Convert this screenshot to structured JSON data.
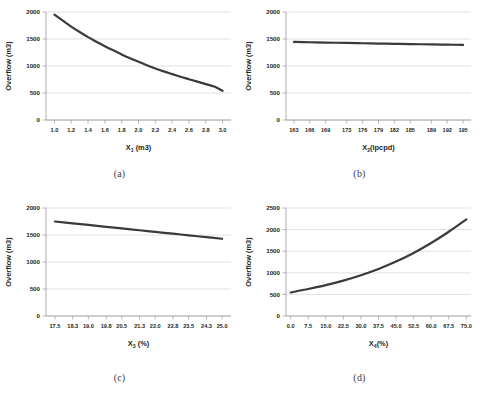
{
  "figure": {
    "background_color": "#ffffff",
    "line_color": "#3a3a3a",
    "grid_color": "#d4d4d4",
    "axis_color": "#9a9a9a",
    "panels": [
      {
        "id": "a",
        "caption": "(a)",
        "ylabel": "Overflow (m3)",
        "xlabel_main": "X",
        "xlabel_sub": "1",
        "xlabel_unit": " (m3)"
      },
      {
        "id": "b",
        "caption": "(b)",
        "ylabel": "Overflow (m3)",
        "xlabel_main": "X",
        "xlabel_sub": "2",
        "xlabel_unit": "(lpcpd)"
      },
      {
        "id": "c",
        "caption": "(c)",
        "ylabel": "Overflow (m3)",
        "xlabel_main": "X",
        "xlabel_sub": "3",
        "xlabel_unit": " (%)"
      },
      {
        "id": "d",
        "caption": "(d)",
        "ylabel": "Overflow (m3)",
        "xlabel_main": "X",
        "xlabel_sub": "4",
        "xlabel_unit": "(%)"
      }
    ]
  },
  "chart_data": [
    {
      "type": "line",
      "id": "a",
      "title": "(a)",
      "xlabel": "X1 (m3)",
      "ylabel": "Overflow (m3)",
      "xlim": [
        0.9,
        3.1
      ],
      "ylim": [
        0,
        2000
      ],
      "grid": true,
      "legend": "none",
      "xticks": [
        1.0,
        1.2,
        1.4,
        1.6,
        1.8,
        2.0,
        2.2,
        2.4,
        2.6,
        2.8,
        3.0
      ],
      "xtick_labels": [
        "1.0",
        "1.2",
        "1.4",
        "1.6",
        "1.8",
        "2.0",
        "2.2",
        "2.4",
        "2.6",
        "2.8",
        "3.0"
      ],
      "yticks": [
        0,
        500,
        1000,
        1500,
        2000
      ],
      "ytick_labels": [
        "0",
        "500",
        "1000",
        "1500",
        "2000"
      ],
      "x": [
        1.0,
        1.1,
        1.2,
        1.3,
        1.4,
        1.5,
        1.6,
        1.7,
        1.8,
        1.9,
        2.0,
        2.1,
        2.2,
        2.3,
        2.4,
        2.5,
        2.6,
        2.7,
        2.8,
        2.9,
        3.0
      ],
      "y": [
        1950,
        1840,
        1730,
        1630,
        1535,
        1450,
        1365,
        1290,
        1215,
        1145,
        1080,
        1015,
        955,
        900,
        850,
        800,
        755,
        710,
        665,
        620,
        540
      ]
    },
    {
      "type": "line",
      "id": "b",
      "title": "(b)",
      "xlabel": "X2 (lpcpd)",
      "ylabel": "Overflow (m3)",
      "xlim": [
        161.5,
        196.5
      ],
      "ylim": [
        0,
        2000
      ],
      "grid": true,
      "legend": "none",
      "xticks": [
        163,
        166,
        169,
        173,
        176,
        179,
        182,
        185,
        189,
        192,
        195
      ],
      "xtick_labels": [
        "163",
        "166",
        "169",
        "173",
        "176",
        "179",
        "182",
        "185",
        "189",
        "192",
        "195"
      ],
      "yticks": [
        0,
        500,
        1000,
        1500,
        2000
      ],
      "ytick_labels": [
        "0",
        "500",
        "1000",
        "1500",
        "2000"
      ],
      "x": [
        163,
        166,
        169,
        173,
        176,
        179,
        182,
        185,
        189,
        192,
        195
      ],
      "y": [
        1445,
        1440,
        1434,
        1427,
        1421,
        1416,
        1411,
        1406,
        1400,
        1395,
        1390
      ]
    },
    {
      "type": "line",
      "id": "c",
      "title": "(c)",
      "xlabel": "X3 (%)",
      "ylabel": "Overflow (m3)",
      "xlim": [
        17.1,
        25.4
      ],
      "ylim": [
        0,
        2000
      ],
      "grid": true,
      "legend": "none",
      "xticks": [
        17.5,
        18.3,
        19.0,
        19.8,
        20.5,
        21.3,
        22.0,
        22.8,
        23.5,
        24.3,
        25.0
      ],
      "xtick_labels": [
        "17.5",
        "18.3",
        "19.0",
        "19.8",
        "20.5",
        "21.3",
        "22.0",
        "22.8",
        "23.5",
        "24.3",
        "25.0"
      ],
      "yticks": [
        0,
        500,
        1000,
        1500,
        2000
      ],
      "ytick_labels": [
        "0",
        "500",
        "1000",
        "1500",
        "2000"
      ],
      "x": [
        17.5,
        18.3,
        19.0,
        19.8,
        20.5,
        21.3,
        22.0,
        22.8,
        23.5,
        24.3,
        25.0
      ],
      "y": [
        1750,
        1716,
        1686,
        1652,
        1622,
        1588,
        1558,
        1524,
        1494,
        1460,
        1430
      ]
    },
    {
      "type": "line",
      "id": "d",
      "title": "(d)",
      "xlabel": "X4 (%)",
      "ylabel": "Overflow (m3)",
      "xlim": [
        -2.0,
        77.0
      ],
      "ylim": [
        0,
        2500
      ],
      "grid": true,
      "legend": "none",
      "xticks": [
        0.0,
        7.5,
        15.0,
        22.5,
        30.0,
        37.5,
        45.0,
        52.5,
        60.0,
        67.5,
        75.0
      ],
      "xtick_labels": [
        "0.0",
        "7.5",
        "15.0",
        "22.5",
        "30.0",
        "37.5",
        "45.0",
        "52.5",
        "60.0",
        "67.5",
        "75.0"
      ],
      "yticks": [
        0,
        500,
        1000,
        1500,
        2000,
        2500
      ],
      "ytick_labels": [
        "0",
        "500",
        "1000",
        "1500",
        "2000",
        "2500"
      ],
      "x": [
        0.0,
        7.5,
        15.0,
        22.5,
        30.0,
        37.5,
        45.0,
        52.5,
        60.0,
        67.5,
        75.0
      ],
      "y": [
        545,
        625,
        715,
        820,
        945,
        1090,
        1260,
        1460,
        1690,
        1950,
        2235
      ]
    }
  ]
}
